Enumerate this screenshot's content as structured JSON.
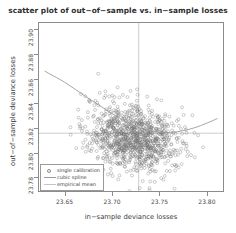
{
  "chart_data": {
    "type": "scatter",
    "title": "scatter plot of out−of−sample vs. in−sample losses",
    "xlabel": "in−sample deviance losses",
    "ylabel": "out−of−sample deviance losses",
    "xlim": [
      23.622,
      23.818
    ],
    "ylim": [
      23.768,
      23.906
    ],
    "grid": false,
    "legend_position": "bottom-left",
    "xticks": [
      "23.65",
      "23.70",
      "23.75",
      "23.80"
    ],
    "xtick_values": [
      23.65,
      23.7,
      23.75,
      23.8
    ],
    "yticks": [
      "23.78",
      "23.80",
      "23.82",
      "23.84",
      "23.86",
      "23.88",
      "23.90"
    ],
    "ytick_values": [
      23.78,
      23.8,
      23.82,
      23.84,
      23.86,
      23.88,
      23.9
    ],
    "marker": "open-circle",
    "marker_color": "#6f6f6f",
    "spline_color": "#9a9a9a",
    "mean_line_color": "#b5b5b5",
    "legend": [
      {
        "label": "single calibration",
        "key": "circle",
        "color": "#8a8a8a"
      },
      {
        "label": "cubic spline",
        "key": "line",
        "color": "#9a9a9a"
      },
      {
        "label": "empirical mean",
        "key": "line",
        "color": "#c0c0c0"
      }
    ],
    "series": [
      {
        "name": "single calibration",
        "type": "scatter",
        "n_points": 1000,
        "x_center": 23.722,
        "y_center": 23.812,
        "x_sd": 0.024,
        "y_sd": 0.014,
        "correlation": -0.18
      },
      {
        "name": "cubic spline",
        "type": "line",
        "x": [
          23.628,
          23.65,
          23.672,
          23.694,
          23.705,
          23.716,
          23.727,
          23.738,
          23.75,
          23.762,
          23.775,
          23.788,
          23.8,
          23.812
        ],
        "y": [
          23.8665,
          23.857,
          23.8455,
          23.8345,
          23.829,
          23.8245,
          23.8205,
          23.818,
          23.8163,
          23.816,
          23.8175,
          23.82,
          23.8235,
          23.8275
        ]
      },
      {
        "name": "empirical mean",
        "type": "crosshair",
        "x_mean": 23.7282,
        "y_mean": 23.8155
      }
    ]
  }
}
